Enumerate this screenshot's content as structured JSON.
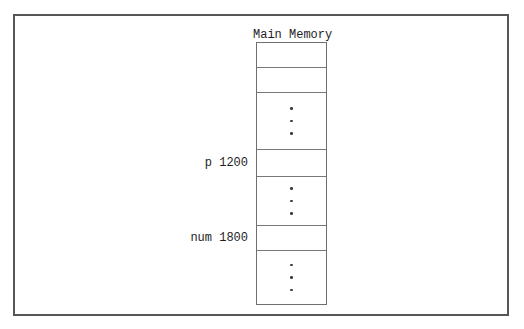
{
  "figure": {
    "title": "Main Memory",
    "column": {
      "cells": [
        {
          "type": "empty",
          "label": ""
        },
        {
          "type": "empty",
          "label": ""
        },
        {
          "type": "ellipsis",
          "label": ""
        },
        {
          "type": "labeled",
          "label": "p 1200"
        },
        {
          "type": "ellipsis",
          "label": ""
        },
        {
          "type": "labeled",
          "label": "num 1800"
        },
        {
          "type": "ellipsis",
          "label": ""
        }
      ]
    },
    "colors": {
      "background": "#ffffff",
      "frame_line": "#565656",
      "cell_line": "#787878",
      "text": "#1e1e1e"
    }
  }
}
